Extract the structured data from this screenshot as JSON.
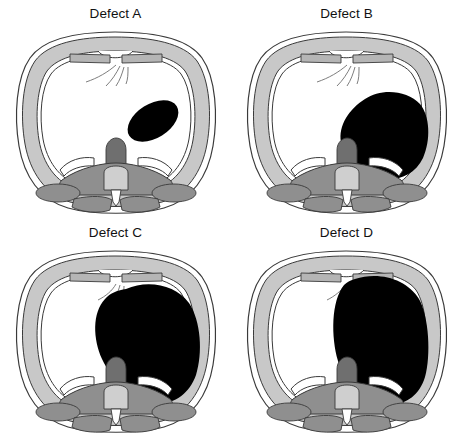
{
  "figure": {
    "kind": "axial-chest-ct-illustration-grid",
    "width": 462,
    "height": 438,
    "background_color": "#ffffff",
    "rows": 2,
    "columns": 2
  },
  "colors": {
    "background": "#ffffff",
    "lesion_fill": "#000000",
    "chest_wall_fill": "#c8c8c8",
    "muscle_fill": "#8f8f8f",
    "bone_fill": "#b5b5b5",
    "vertebral_body_fill": "#cfcfcf",
    "lung_fill": "#ffffff",
    "outline": "#3a3a3a",
    "fissure_line": "#6e6e6e",
    "title_text": "#111111"
  },
  "panels": [
    {
      "id": "defect-a",
      "title": "Defect A",
      "position": {
        "row": 1,
        "column": 1,
        "x": 0,
        "y": 0
      },
      "lesion": {
        "name": "defect-a-lesion",
        "shape": "ellipse",
        "description": "small oblique oval opacity in left mid lung field",
        "center_x": 153,
        "center_y": 97,
        "radius_x": 28,
        "radius_y": 17,
        "rotation_deg": -32,
        "fill": "#000000",
        "relative_size": "small"
      }
    },
    {
      "id": "defect-b",
      "title": "Defect B",
      "position": {
        "row": 1,
        "column": 2,
        "x": 231,
        "y": 0
      },
      "lesion": {
        "name": "defect-b-lesion",
        "shape": "irregular-blob",
        "description": "moderate rounded opacity occupying lower left hemithorax",
        "center_x": 152,
        "center_y": 110,
        "radius_x": 47,
        "radius_y": 45,
        "fill": "#000000",
        "relative_size": "moderate"
      }
    },
    {
      "id": "defect-c",
      "title": "Defect C",
      "position": {
        "row": 2,
        "column": 1,
        "x": 0,
        "y": 219
      },
      "lesion": {
        "name": "defect-c-lesion",
        "shape": "irregular-blob",
        "description": "large opacity filling most of left hemithorax, sparing the apex",
        "center_x": 152,
        "center_y": 97,
        "radius_x": 56,
        "radius_y": 62,
        "fill": "#000000",
        "relative_size": "large"
      }
    },
    {
      "id": "defect-d",
      "title": "Defect D",
      "position": {
        "row": 2,
        "column": 2,
        "x": 231,
        "y": 219
      },
      "lesion": {
        "name": "defect-d-lesion",
        "shape": "irregular-blob",
        "description": "very large opacity filling the entire left hemithorax from apex to diaphragm",
        "center_x": 150,
        "center_y": 88,
        "radius_x": 58,
        "radius_y": 74,
        "fill": "#000000",
        "relative_size": "very-large"
      }
    }
  ],
  "anatomy": {
    "labels": {
      "chest_wall": "chest wall",
      "sternum": "sternum",
      "lung": "lung field",
      "fissure": "lung fissure",
      "vertebra": "vertebral body",
      "spinal_canal": "spinal canal",
      "paraspinal_muscle": "paraspinal muscle",
      "rib": "rib",
      "scapula": "scapula"
    }
  }
}
